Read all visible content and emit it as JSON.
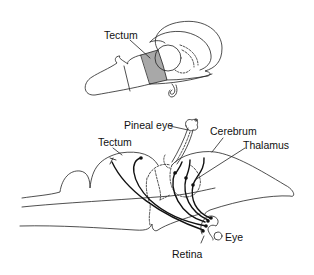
{
  "top_figure": {
    "labels": {
      "tectum": "Tectum"
    },
    "highlight_color": "#a8a8a8"
  },
  "bottom_figure": {
    "labels": {
      "pineal_eye": "Pineal eye",
      "cerebrum": "Cerebrum",
      "tectum": "Tectum",
      "thalamus": "Thalamus",
      "eye": "Eye",
      "retina": "Retina"
    }
  },
  "colors": {
    "line": "#222222",
    "background": "#ffffff"
  }
}
